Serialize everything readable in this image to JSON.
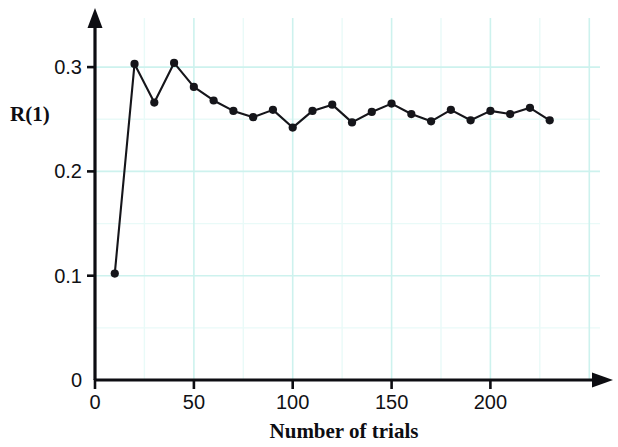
{
  "chart_data": {
    "type": "line",
    "title": "",
    "xlabel": "Number of trials",
    "ylabel": "R(1)",
    "x": [
      10,
      20,
      30,
      40,
      50,
      60,
      70,
      80,
      90,
      100,
      110,
      120,
      130,
      140,
      150,
      160,
      170,
      180,
      190,
      200,
      210,
      220,
      230
    ],
    "values": [
      0.102,
      0.303,
      0.266,
      0.304,
      0.281,
      0.268,
      0.258,
      0.252,
      0.259,
      0.242,
      0.258,
      0.264,
      0.247,
      0.257,
      0.265,
      0.255,
      0.248,
      0.259,
      0.249,
      0.258,
      0.255,
      0.261,
      0.249
    ],
    "series": [
      {
        "name": "R(1)",
        "values": [
          0.102,
          0.303,
          0.266,
          0.304,
          0.281,
          0.268,
          0.258,
          0.252,
          0.259,
          0.242,
          0.258,
          0.264,
          0.247,
          0.257,
          0.265,
          0.255,
          0.248,
          0.259,
          0.249,
          0.258,
          0.255,
          0.261,
          0.249
        ]
      }
    ],
    "xlim": [
      0,
      260
    ],
    "ylim": [
      0,
      0.325
    ],
    "xticks": [
      0,
      50,
      100,
      150,
      200
    ],
    "xtick_labels": [
      "0",
      "50",
      "100",
      "150",
      "200"
    ],
    "yticks": [
      0,
      0.1,
      0.2,
      0.3
    ],
    "ytick_labels": [
      "0",
      "0.1",
      "0.2",
      "0.3"
    ],
    "grid": true,
    "grid_color": "#cdf2ee",
    "grid_minor_color": "#e9faf8",
    "grid_x_values": [
      50,
      100,
      150,
      200,
      250
    ],
    "grid_y_values": [
      0.05,
      0.1,
      0.15,
      0.2,
      0.25,
      0.3
    ],
    "legend": "none",
    "line_color": "#15151a",
    "marker": "circle",
    "marker_color": "#15151a",
    "axis_color": "#0d0d12",
    "axis_arrows": true,
    "background": "#ffffff"
  },
  "labels": {
    "y_axis_title": "R(1)",
    "x_axis_title": "Number of trials"
  }
}
